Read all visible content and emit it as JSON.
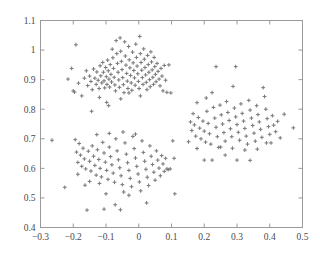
{
  "chart_data": {
    "type": "scatter",
    "title": "",
    "xlabel": "",
    "ylabel": "",
    "xlim": [
      -0.3,
      0.5
    ],
    "ylim": [
      0.4,
      1.1
    ],
    "xticks": [
      -0.3,
      -0.2,
      -0.1,
      0,
      0.1,
      0.2,
      0.3,
      0.4,
      0.5
    ],
    "xticklabels": [
      "−0.3",
      "−0.2",
      "−0.1",
      "0",
      "0.1",
      "0.2",
      "0.3",
      "0.4",
      "0.5"
    ],
    "yticks": [
      0.4,
      0.5,
      0.6,
      0.7,
      0.8,
      0.9,
      1.0,
      1.1
    ],
    "yticklabels": [
      "0.4",
      "0.5",
      "0.6",
      "0.7",
      "0.8",
      "0.9",
      "1",
      "1.1"
    ],
    "grid": false,
    "legend": null,
    "marker": "plus",
    "marker_color": "#7b7b7b",
    "marker_size": 3,
    "frame_color": "#9a9a9a",
    "background": "#ffffff",
    "series": [
      {
        "name": "cluster-top",
        "center": [
          -0.047,
          0.925
        ],
        "points": [
          [
            -0.192,
            1.018
          ],
          [
            -0.205,
            0.938
          ],
          [
            -0.216,
            0.902
          ],
          [
            -0.2,
            0.862
          ],
          [
            -0.196,
            0.858
          ],
          [
            -0.184,
            0.888
          ],
          [
            -0.174,
            0.845
          ],
          [
            -0.166,
            0.905
          ],
          [
            -0.16,
            0.93
          ],
          [
            -0.156,
            0.88
          ],
          [
            -0.15,
            0.912
          ],
          [
            -0.146,
            0.894
          ],
          [
            -0.142,
            0.866
          ],
          [
            -0.138,
            0.936
          ],
          [
            -0.134,
            0.905
          ],
          [
            -0.13,
            0.884
          ],
          [
            -0.128,
            0.926
          ],
          [
            -0.124,
            0.898
          ],
          [
            -0.121,
            0.87
          ],
          [
            -0.118,
            0.947
          ],
          [
            -0.116,
            0.913
          ],
          [
            -0.113,
            0.889
          ],
          [
            -0.11,
            0.958
          ],
          [
            -0.108,
            0.925
          ],
          [
            -0.106,
            0.896
          ],
          [
            -0.104,
            0.872
          ],
          [
            -0.101,
            0.941
          ],
          [
            -0.099,
            0.91
          ],
          [
            -0.097,
            0.884
          ],
          [
            -0.095,
            0.966
          ],
          [
            -0.093,
            0.93
          ],
          [
            -0.091,
            0.902
          ],
          [
            -0.089,
            0.875
          ],
          [
            -0.087,
            0.951
          ],
          [
            -0.085,
            0.918
          ],
          [
            -0.083,
            0.892
          ],
          [
            -0.081,
            1.003
          ],
          [
            -0.079,
            0.974
          ],
          [
            -0.077,
            0.938
          ],
          [
            -0.075,
            0.908
          ],
          [
            -0.073,
            0.882
          ],
          [
            -0.071,
            0.862
          ],
          [
            -0.069,
            1.032
          ],
          [
            -0.067,
            0.988
          ],
          [
            -0.065,
            0.955
          ],
          [
            -0.063,
            0.925
          ],
          [
            -0.061,
            0.899
          ],
          [
            -0.059,
            0.874
          ],
          [
            -0.057,
            1.041
          ],
          [
            -0.055,
            0.996
          ],
          [
            -0.053,
            0.962
          ],
          [
            -0.051,
            0.934
          ],
          [
            -0.049,
            0.907
          ],
          [
            -0.047,
            0.883
          ],
          [
            -0.045,
            0.856
          ],
          [
            -0.043,
            1.028
          ],
          [
            -0.041,
            0.98
          ],
          [
            -0.039,
            0.949
          ],
          [
            -0.037,
            0.921
          ],
          [
            -0.035,
            0.895
          ],
          [
            -0.033,
            0.87
          ],
          [
            -0.031,
            1.012
          ],
          [
            -0.029,
            0.967
          ],
          [
            -0.027,
            0.94
          ],
          [
            -0.025,
            0.914
          ],
          [
            -0.023,
            0.889
          ],
          [
            -0.021,
            0.864
          ],
          [
            -0.019,
            0.993
          ],
          [
            -0.017,
            0.957
          ],
          [
            -0.015,
            0.931
          ],
          [
            -0.013,
            0.906
          ],
          [
            -0.011,
            0.881
          ],
          [
            -0.009,
            1.02
          ],
          [
            -0.007,
            0.975
          ],
          [
            -0.005,
            0.946
          ],
          [
            -0.003,
            0.92
          ],
          [
            -0.001,
            0.894
          ],
          [
            0.001,
            0.87
          ],
          [
            0.003,
            1.046
          ],
          [
            0.005,
            0.988
          ],
          [
            0.007,
            0.958
          ],
          [
            0.009,
            0.932
          ],
          [
            0.011,
            0.907
          ],
          [
            0.013,
            0.884
          ],
          [
            0.015,
            1.004
          ],
          [
            0.017,
            0.969
          ],
          [
            0.019,
            0.941
          ],
          [
            0.021,
            0.916
          ],
          [
            0.023,
            0.891
          ],
          [
            0.025,
            0.866
          ],
          [
            0.027,
            0.982
          ],
          [
            0.029,
            0.951
          ],
          [
            0.031,
            0.925
          ],
          [
            0.033,
            0.9
          ],
          [
            0.035,
            0.876
          ],
          [
            0.037,
            0.994
          ],
          [
            0.039,
            0.96
          ],
          [
            0.041,
            0.933
          ],
          [
            0.043,
            0.908
          ],
          [
            0.045,
            0.884
          ],
          [
            0.047,
            0.975
          ],
          [
            0.049,
            0.944
          ],
          [
            0.051,
            0.918
          ],
          [
            0.053,
            0.893
          ],
          [
            0.056,
            0.955
          ],
          [
            0.059,
            0.928
          ],
          [
            0.062,
            0.902
          ],
          [
            0.065,
            0.879
          ],
          [
            0.068,
            0.938
          ],
          [
            0.071,
            0.912
          ],
          [
            0.074,
            0.862
          ],
          [
            0.078,
            0.948
          ],
          [
            0.082,
            0.898
          ],
          [
            0.086,
            0.857
          ],
          [
            0.092,
            0.95
          ],
          [
            0.098,
            0.855
          ],
          [
            -0.12,
            0.84
          ],
          [
            -0.055,
            0.835
          ],
          [
            -0.098,
            0.823
          ],
          [
            -0.092,
            0.812
          ],
          [
            -0.144,
            0.793
          ],
          [
            -0.03,
            0.855
          ],
          [
            0.005,
            0.845
          ]
        ]
      },
      {
        "name": "cluster-bottom-left",
        "center": [
          -0.065,
          0.625
        ],
        "points": [
          [
            -0.265,
            0.695
          ],
          [
            -0.226,
            0.536
          ],
          [
            -0.194,
            0.697
          ],
          [
            -0.19,
            0.655
          ],
          [
            -0.186,
            0.62
          ],
          [
            -0.182,
            0.684
          ],
          [
            -0.178,
            0.645
          ],
          [
            -0.174,
            0.607
          ],
          [
            -0.17,
            0.668
          ],
          [
            -0.166,
            0.632
          ],
          [
            -0.162,
            0.598
          ],
          [
            -0.158,
            0.459
          ],
          [
            -0.154,
            0.658
          ],
          [
            -0.15,
            0.624
          ],
          [
            -0.146,
            0.591
          ],
          [
            -0.142,
            0.676
          ],
          [
            -0.138,
            0.641
          ],
          [
            -0.134,
            0.61
          ],
          [
            -0.13,
            0.577
          ],
          [
            -0.126,
            0.663
          ],
          [
            -0.122,
            0.63
          ],
          [
            -0.118,
            0.6
          ],
          [
            -0.114,
            0.571
          ],
          [
            -0.11,
            0.688
          ],
          [
            -0.106,
            0.652
          ],
          [
            -0.102,
            0.621
          ],
          [
            -0.098,
            0.593
          ],
          [
            -0.094,
            0.563
          ],
          [
            -0.09,
            0.672
          ],
          [
            -0.086,
            0.64
          ],
          [
            -0.082,
            0.612
          ],
          [
            -0.078,
            0.584
          ],
          [
            -0.074,
            0.553
          ],
          [
            -0.07,
            0.7
          ],
          [
            -0.066,
            0.659
          ],
          [
            -0.062,
            0.629
          ],
          [
            -0.058,
            0.602
          ],
          [
            -0.054,
            0.575
          ],
          [
            -0.05,
            0.545
          ],
          [
            -0.046,
            0.52
          ],
          [
            -0.042,
            0.686
          ],
          [
            -0.038,
            0.648
          ],
          [
            -0.034,
            0.619
          ],
          [
            -0.03,
            0.593
          ],
          [
            -0.026,
            0.566
          ],
          [
            -0.022,
            0.538
          ],
          [
            -0.018,
            0.708
          ],
          [
            -0.014,
            0.667
          ],
          [
            -0.01,
            0.635
          ],
          [
            -0.006,
            0.607
          ],
          [
            -0.002,
            0.581
          ],
          [
            0.002,
            0.554
          ],
          [
            0.006,
            0.524
          ],
          [
            0.01,
            0.693
          ],
          [
            0.014,
            0.654
          ],
          [
            0.018,
            0.624
          ],
          [
            0.022,
            0.597
          ],
          [
            0.026,
            0.57
          ],
          [
            0.03,
            0.542
          ],
          [
            0.034,
            0.676
          ],
          [
            0.038,
            0.641
          ],
          [
            0.042,
            0.613
          ],
          [
            0.046,
            0.587
          ],
          [
            0.05,
            0.56
          ],
          [
            0.054,
            0.659
          ],
          [
            0.058,
            0.628
          ],
          [
            0.062,
            0.601
          ],
          [
            0.066,
            0.575
          ],
          [
            0.07,
            0.643
          ],
          [
            0.074,
            0.615
          ],
          [
            0.078,
            0.59
          ],
          [
            0.082,
            0.634
          ],
          [
            0.086,
            0.598
          ],
          [
            0.09,
            0.596
          ],
          [
            0.096,
            0.598
          ],
          [
            0.104,
            0.693
          ],
          [
            0.108,
            0.634
          ],
          [
            0.11,
            0.514
          ],
          [
            -0.15,
            0.556
          ],
          [
            -0.12,
            0.549
          ],
          [
            -0.1,
            0.514
          ],
          [
            -0.072,
            0.477
          ],
          [
            -0.056,
            0.46
          ],
          [
            -0.03,
            0.509
          ],
          [
            -0.128,
            0.714
          ],
          [
            -0.09,
            0.718
          ],
          [
            -0.048,
            0.723
          ],
          [
            -0.01,
            0.716
          ],
          [
            -0.186,
            0.58
          ],
          [
            -0.164,
            0.543
          ],
          [
            0.024,
            0.483
          ],
          [
            -0.106,
            0.462
          ]
        ]
      },
      {
        "name": "cluster-right",
        "center": [
          0.29,
          0.757
        ],
        "points": [
          [
            0.152,
            0.69
          ],
          [
            0.158,
            0.757
          ],
          [
            0.162,
            0.728
          ],
          [
            0.166,
            0.785
          ],
          [
            0.17,
            0.747
          ],
          [
            0.174,
            0.709
          ],
          [
            0.178,
            0.667
          ],
          [
            0.182,
            0.772
          ],
          [
            0.186,
            0.736
          ],
          [
            0.19,
            0.7
          ],
          [
            0.196,
            0.76
          ],
          [
            0.2,
            0.726
          ],
          [
            0.204,
            0.689
          ],
          [
            0.208,
            0.793
          ],
          [
            0.212,
            0.752
          ],
          [
            0.216,
            0.717
          ],
          [
            0.22,
            0.682
          ],
          [
            0.224,
            0.856
          ],
          [
            0.228,
            0.806
          ],
          [
            0.232,
            0.77
          ],
          [
            0.236,
            0.739
          ],
          [
            0.24,
            0.707
          ],
          [
            0.244,
            0.671
          ],
          [
            0.248,
            0.814
          ],
          [
            0.252,
            0.781
          ],
          [
            0.256,
            0.75
          ],
          [
            0.26,
            0.721
          ],
          [
            0.264,
            0.692
          ],
          [
            0.268,
            0.826
          ],
          [
            0.272,
            0.789
          ],
          [
            0.276,
            0.762
          ],
          [
            0.28,
            0.734
          ],
          [
            0.284,
            0.707
          ],
          [
            0.288,
            0.877
          ],
          [
            0.292,
            0.804
          ],
          [
            0.296,
            0.774
          ],
          [
            0.3,
            0.748
          ],
          [
            0.304,
            0.722
          ],
          [
            0.308,
            0.695
          ],
          [
            0.312,
            0.818
          ],
          [
            0.316,
            0.786
          ],
          [
            0.32,
            0.76
          ],
          [
            0.324,
            0.735
          ],
          [
            0.328,
            0.709
          ],
          [
            0.332,
            0.682
          ],
          [
            0.336,
            0.83
          ],
          [
            0.34,
            0.797
          ],
          [
            0.344,
            0.77
          ],
          [
            0.348,
            0.745
          ],
          [
            0.352,
            0.719
          ],
          [
            0.356,
            0.692
          ],
          [
            0.36,
            0.812
          ],
          [
            0.364,
            0.782
          ],
          [
            0.368,
            0.757
          ],
          [
            0.372,
            0.732
          ],
          [
            0.376,
            0.705
          ],
          [
            0.38,
            0.873
          ],
          [
            0.384,
            0.843
          ],
          [
            0.388,
            0.8
          ],
          [
            0.392,
            0.768
          ],
          [
            0.396,
            0.741
          ],
          [
            0.4,
            0.715
          ],
          [
            0.404,
            0.686
          ],
          [
            0.408,
            0.778
          ],
          [
            0.412,
            0.746
          ],
          [
            0.418,
            0.724
          ],
          [
            0.424,
            0.759
          ],
          [
            0.432,
            0.703
          ],
          [
            0.444,
            0.783
          ],
          [
            0.472,
            0.737
          ],
          [
            0.236,
            0.944
          ],
          [
            0.296,
            0.944
          ],
          [
            0.2,
            0.628
          ],
          [
            0.224,
            0.628
          ],
          [
            0.264,
            0.645
          ],
          [
            0.3,
            0.628
          ],
          [
            0.34,
            0.627
          ],
          [
            0.178,
            0.822
          ],
          [
            0.206,
            0.838
          ],
          [
            0.25,
            0.672
          ],
          [
            0.286,
            0.668
          ],
          [
            0.324,
            0.662
          ],
          [
            0.362,
            0.665
          ],
          [
            0.39,
            0.686
          ]
        ]
      }
    ]
  }
}
